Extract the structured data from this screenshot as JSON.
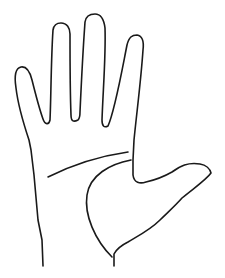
{
  "image": {
    "subject": "hand outline line drawing",
    "background_color": "#ffffff",
    "stroke_color": "#1a1a1a",
    "elements": [
      "hand-outline",
      "heart-line",
      "life-line"
    ]
  }
}
